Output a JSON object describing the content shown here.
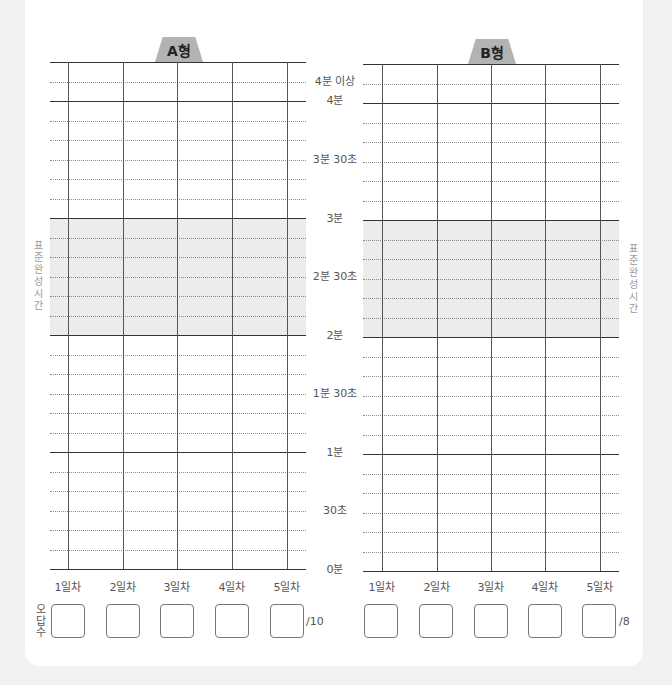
{
  "chart_data": [
    {
      "type": "table",
      "title": "A형",
      "categories": [
        "1일차",
        "2일차",
        "3일차",
        "4일차",
        "5일차"
      ],
      "ylabel": "표준완성시간",
      "y_ticks": [
        "0분",
        "30초",
        "1분",
        "1분 30초",
        "2분",
        "2분 30초",
        "3분",
        "3분 30초",
        "4분",
        "4분 이상"
      ],
      "y_range_seconds": [
        0,
        260
      ],
      "minor_step_seconds": 10,
      "standard_band_seconds": [
        120,
        180
      ],
      "values": [],
      "wrong_answers_total": "/10"
    },
    {
      "type": "table",
      "title": "B형",
      "categories": [
        "1일차",
        "2일차",
        "3일차",
        "4일차",
        "5일차"
      ],
      "ylabel": "표준완성시간",
      "y_ticks": [
        "0분",
        "30초",
        "1분",
        "1분 30초",
        "2분",
        "2분 30초",
        "3분",
        "3분 30초",
        "4분",
        "4분 이상"
      ],
      "y_range_seconds": [
        0,
        260
      ],
      "minor_step_seconds": 10,
      "standard_band_seconds": [
        120,
        180
      ],
      "values": [],
      "wrong_answers_total": "/8"
    }
  ],
  "chartA": {
    "tab": "A형",
    "total": "/10"
  },
  "chartB": {
    "tab": "B형",
    "total": "/8"
  },
  "days": [
    "1일차",
    "2일차",
    "3일차",
    "4일차",
    "5일차"
  ],
  "yaxis": {
    "over4": "4분 이상",
    "m4": "4분",
    "m3s30": "3분 30초",
    "m3": "3분",
    "m2s30": "2분 30초",
    "m2": "2분",
    "m1s30": "1분 30초",
    "m1": "1분",
    "s30": "30초",
    "m0": "0분"
  },
  "standard_time_label": "표준완성시간",
  "wrong_count_label": "오답수",
  "colors": {
    "band": "#ececec",
    "tab": "#b3b3b3",
    "background": "#f2f2f2"
  }
}
